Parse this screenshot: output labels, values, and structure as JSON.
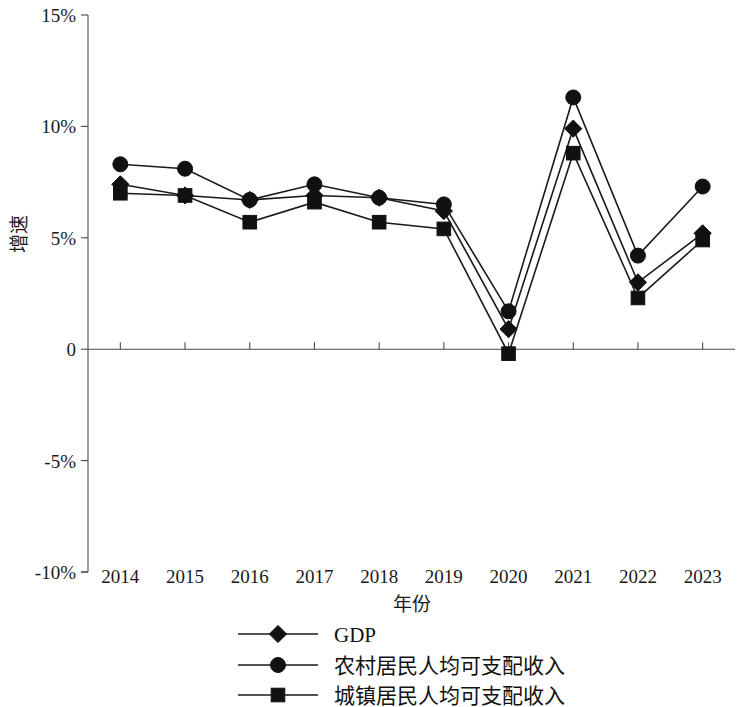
{
  "chart_data": {
    "type": "line",
    "title": "",
    "subtitle": "",
    "xlabel": "年份",
    "ylabel": "增速",
    "categories": [
      "2014",
      "2015",
      "2016",
      "2017",
      "2018",
      "2019",
      "2020",
      "2021",
      "2022",
      "2023"
    ],
    "x_tick_labels": [
      "2014",
      "2015",
      "2016",
      "2017",
      "2018",
      "2019",
      "2020",
      "2021",
      "2022",
      "2023"
    ],
    "y_tick_labels": [
      "15%",
      "10%",
      "5%",
      "0",
      "-5%",
      "-10%"
    ],
    "y_tick_values": [
      15,
      10,
      5,
      0,
      -5,
      -10
    ],
    "ylim": [
      -10,
      15
    ],
    "grid": false,
    "legend_position": "bottom-center",
    "series": [
      {
        "name": "GDP",
        "marker": "diamond",
        "color": "#111111",
        "values": [
          7.4,
          6.9,
          6.7,
          6.9,
          6.8,
          6.2,
          0.9,
          9.9,
          3.0,
          5.2
        ]
      },
      {
        "name": "农村居民人均可支配收入",
        "marker": "circle",
        "color": "#111111",
        "values": [
          8.3,
          8.1,
          6.7,
          7.4,
          6.8,
          6.5,
          1.7,
          11.3,
          4.2,
          7.3
        ]
      },
      {
        "name": "城镇居民人均可支配收入",
        "marker": "square",
        "color": "#111111",
        "values": [
          7.0,
          6.9,
          5.7,
          6.6,
          5.7,
          5.4,
          -0.2,
          8.8,
          2.3,
          4.9
        ]
      }
    ]
  },
  "legend": {
    "items": [
      {
        "label": "GDP",
        "marker": "diamond-marker-icon"
      },
      {
        "label": "农村居民人均可支配收入",
        "marker": "circle-marker-icon"
      },
      {
        "label": "城镇居民人均可支配收入",
        "marker": "square-marker-icon"
      }
    ]
  },
  "axes": {
    "x_title": "年份",
    "y_title": "增速"
  }
}
